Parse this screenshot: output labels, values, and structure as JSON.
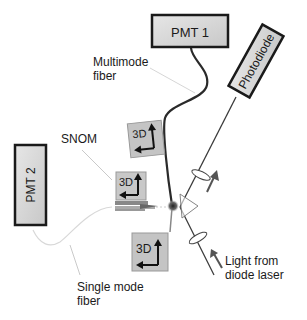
{
  "diagram": {
    "boxes": {
      "pmt1": {
        "label": "PMT 1"
      },
      "pmt2": {
        "label": "PMT 2"
      },
      "photodiode": {
        "label": "Photodiode"
      }
    },
    "stages": {
      "stage_top": {
        "label": "3D"
      },
      "stage_snom": {
        "label": "3D"
      },
      "stage_bottom": {
        "label": "3D"
      }
    },
    "annotations": {
      "multimode_fiber": [
        "Multimode",
        "fiber"
      ],
      "snom": "SNOM",
      "single_mode_fiber": [
        "Single mode",
        "fiber"
      ],
      "light_source": [
        "Light from",
        "diode laser"
      ]
    },
    "colors": {
      "box_fill": "#d4d4d4",
      "stage_fill": "#c4c4c4",
      "stroke": "#1a1a1a",
      "fiber_light": "#cfcfcf",
      "arrow_gray": "#555555"
    }
  }
}
